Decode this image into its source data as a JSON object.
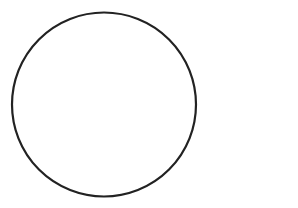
{
  "diagram": {
    "background": "#ffffff",
    "shapes": [
      {
        "type": "circle",
        "cx": 104,
        "cy": 104.5,
        "r": 92,
        "stroke": "#222222",
        "stroke_width": 2.2,
        "fill": "none"
      }
    ]
  }
}
